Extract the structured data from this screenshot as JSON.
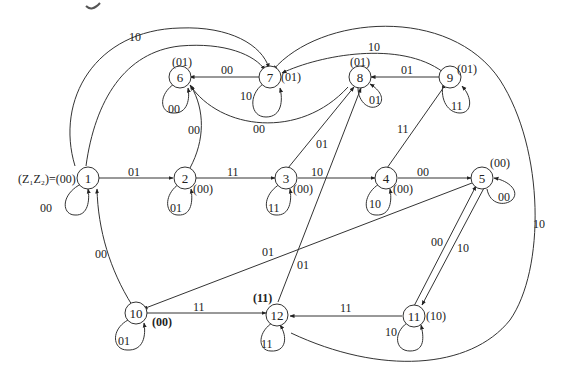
{
  "diagram": {
    "type": "state-transition-diagram",
    "initial_label": "(Z₁Z₂)=(00)",
    "states": [
      {
        "id": "1",
        "output": "(00)"
      },
      {
        "id": "2",
        "output": "(00)"
      },
      {
        "id": "3",
        "output": "(00)"
      },
      {
        "id": "4",
        "output": "(00)"
      },
      {
        "id": "5",
        "output": "(00)"
      },
      {
        "id": "6",
        "output": "(01)"
      },
      {
        "id": "7",
        "output": "(01)"
      },
      {
        "id": "8",
        "output": "(01)"
      },
      {
        "id": "9",
        "output": "(01)"
      },
      {
        "id": "10",
        "output": "(00)"
      },
      {
        "id": "11",
        "output": "(10)"
      },
      {
        "id": "12",
        "output": "(11)"
      }
    ],
    "transitions": [
      {
        "from": "1",
        "to": "1",
        "input": "00"
      },
      {
        "from": "1",
        "to": "2",
        "input": "01"
      },
      {
        "from": "1",
        "to": "7",
        "input": "10"
      },
      {
        "from": "2",
        "to": "2",
        "input": "01"
      },
      {
        "from": "2",
        "to": "3",
        "input": "11"
      },
      {
        "from": "2",
        "to": "6",
        "input": "00"
      },
      {
        "from": "3",
        "to": "3",
        "input": "11"
      },
      {
        "from": "3",
        "to": "4",
        "input": "10"
      },
      {
        "from": "3",
        "to": "8",
        "input": "01"
      },
      {
        "from": "4",
        "to": "4",
        "input": "10"
      },
      {
        "from": "4",
        "to": "5",
        "input": "00"
      },
      {
        "from": "4",
        "to": "9",
        "input": "11"
      },
      {
        "from": "5",
        "to": "5",
        "input": "00"
      },
      {
        "from": "5",
        "to": "10",
        "input": "01"
      },
      {
        "from": "5",
        "to": "11",
        "input": "10"
      },
      {
        "from": "11",
        "to": "5",
        "input": "00"
      },
      {
        "from": "6",
        "to": "6",
        "input": "00"
      },
      {
        "from": "7",
        "to": "6",
        "input": "00"
      },
      {
        "from": "7",
        "to": "7",
        "input": "10"
      },
      {
        "from": "8",
        "to": "6",
        "input": "00"
      },
      {
        "from": "8",
        "to": "8",
        "input": "01"
      },
      {
        "from": "9",
        "to": "8",
        "input": "01"
      },
      {
        "from": "9",
        "to": "7",
        "input": "10"
      },
      {
        "from": "9",
        "to": "9",
        "input": "11"
      },
      {
        "from": "10",
        "to": "1",
        "input": "00"
      },
      {
        "from": "10",
        "to": "10",
        "input": "01"
      },
      {
        "from": "10",
        "to": "12",
        "input": "11"
      },
      {
        "from": "12",
        "to": "8",
        "input": "01"
      },
      {
        "from": "12",
        "to": "12",
        "input": "11"
      },
      {
        "from": "11",
        "to": "12",
        "input": "11"
      },
      {
        "from": "11",
        "to": "11",
        "input": "10"
      },
      {
        "from": "12",
        "to": "7",
        "input": "10"
      }
    ]
  },
  "labels": {
    "initial": "(Z₁Z₂)=(00)",
    "n1": "1",
    "n2": "2",
    "n3": "3",
    "n4": "4",
    "n5": "5",
    "n6": "6",
    "n7": "7",
    "n8": "8",
    "n9": "9",
    "n10": "10",
    "n11": "11",
    "n12": "12",
    "o2": "(00)",
    "o3": "(00)",
    "o4": "(00)",
    "o5": "(00)",
    "o6": "(01)",
    "o7": "(01)",
    "o8": "(01)",
    "o9": "(01)",
    "o10": "(00)",
    "o11": "(10)",
    "o12": "(11)",
    "e_1_1": "00",
    "e_1_2": "01",
    "e_1_7": "10",
    "e_2_2": "01",
    "e_2_3": "11",
    "e_2_6": "00",
    "e_3_3": "11",
    "e_3_4": "10",
    "e_3_8": "01",
    "e_4_4": "10",
    "e_4_5": "00",
    "e_4_9": "11",
    "e_5_5": "00",
    "e_5_10": "01",
    "e_5_11": "10",
    "e_11_5": "00",
    "e_6_6": "00",
    "e_7_6": "00",
    "e_7_7": "10",
    "e_8_6": "00",
    "e_8_8": "01",
    "e_9_8": "01",
    "e_9_7": "10",
    "e_9_9": "11",
    "e_10_1": "00",
    "e_10_10": "01",
    "e_10_12": "11",
    "e_12_8": "01",
    "e_12_12": "11",
    "e_11_12": "11",
    "e_11_11": "10",
    "e_12_7": "10"
  }
}
